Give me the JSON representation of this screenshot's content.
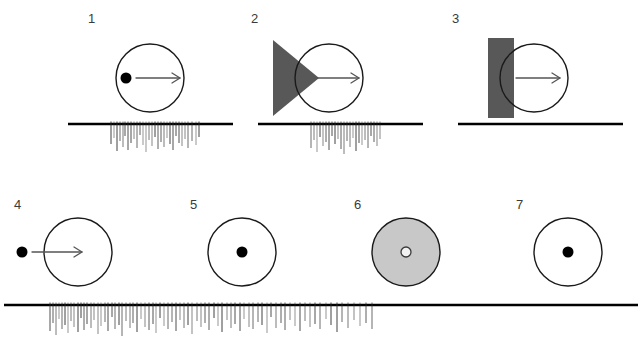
{
  "figure": {
    "kind": "neurophysiology-stimulus-response-figure",
    "background_color": "#ffffff",
    "ink_color": "#000000",
    "label_color": "#3a3a3a",
    "shape_dark_gray": "#585858",
    "shape_light_gray": "#c8c8c8",
    "circle_stroke": "#1a1a1a",
    "arrow_color": "#555555",
    "spike_color": "#2b2b2b",
    "baseline_color": "#000000"
  },
  "panels": [
    {
      "label": "1",
      "label_x": 88,
      "label_y": 12,
      "stimulus": {
        "name": "dot-inside-circle-moving-right",
        "circle": {
          "cx": 72,
          "cy": 58,
          "r": 34,
          "fill": "none"
        },
        "dot": {
          "cx": 48,
          "cy": 58,
          "r": 5.5,
          "style": "filled"
        },
        "arrow": {
          "x1": 58,
          "y1": 58,
          "x2": 102,
          "y2": 58
        },
        "occluder": null
      },
      "trace": {
        "name": "spike-train-1",
        "x": 68,
        "y": 118,
        "width": 165,
        "height": 36,
        "baseline_y": 6,
        "responds": true,
        "spike_start": 42,
        "spike_end": 132,
        "spikes": [
          {
            "x": 43,
            "h": 20
          },
          {
            "x": 46,
            "h": 14
          },
          {
            "x": 49,
            "h": 27
          },
          {
            "x": 52,
            "h": 17
          },
          {
            "x": 55,
            "h": 23
          },
          {
            "x": 57,
            "h": 12
          },
          {
            "x": 60,
            "h": 26
          },
          {
            "x": 63,
            "h": 19
          },
          {
            "x": 66,
            "h": 15
          },
          {
            "x": 69,
            "h": 24
          },
          {
            "x": 72,
            "h": 11
          },
          {
            "x": 75,
            "h": 21
          },
          {
            "x": 78,
            "h": 28
          },
          {
            "x": 81,
            "h": 16
          },
          {
            "x": 84,
            "h": 22
          },
          {
            "x": 87,
            "h": 13
          },
          {
            "x": 90,
            "h": 25
          },
          {
            "x": 93,
            "h": 18
          },
          {
            "x": 96,
            "h": 23
          },
          {
            "x": 99,
            "h": 14
          },
          {
            "x": 102,
            "h": 20
          },
          {
            "x": 105,
            "h": 26
          },
          {
            "x": 108,
            "h": 12
          },
          {
            "x": 111,
            "h": 19
          },
          {
            "x": 114,
            "h": 22
          },
          {
            "x": 117,
            "h": 15
          },
          {
            "x": 120,
            "h": 24
          },
          {
            "x": 124,
            "h": 17
          },
          {
            "x": 128,
            "h": 21
          },
          {
            "x": 131,
            "h": 13
          }
        ]
      }
    },
    {
      "label": "2",
      "label_x": 251,
      "label_y": 12,
      "stimulus": {
        "name": "triangle-occluder-with-circle-moving-right",
        "circle": {
          "cx": 88,
          "cy": 58,
          "r": 34,
          "fill": "none"
        },
        "dot": null,
        "arrow": {
          "x1": 74,
          "y1": 58,
          "x2": 118,
          "y2": 58
        },
        "occluder": {
          "shape": "triangle",
          "points": "32,20 32,96 78,58",
          "fill": "#585858"
        }
      },
      "trace": {
        "name": "spike-train-2",
        "x": 258,
        "y": 118,
        "width": 165,
        "height": 36,
        "baseline_y": 6,
        "responds": true,
        "spike_start": 52,
        "spike_end": 122,
        "spikes": [
          {
            "x": 53,
            "h": 24
          },
          {
            "x": 56,
            "h": 16
          },
          {
            "x": 59,
            "h": 28
          },
          {
            "x": 62,
            "h": 13
          },
          {
            "x": 65,
            "h": 22
          },
          {
            "x": 68,
            "h": 18
          },
          {
            "x": 71,
            "h": 26
          },
          {
            "x": 74,
            "h": 12
          },
          {
            "x": 77,
            "h": 20
          },
          {
            "x": 80,
            "h": 15
          },
          {
            "x": 83,
            "h": 25
          },
          {
            "x": 86,
            "h": 30
          },
          {
            "x": 89,
            "h": 17
          },
          {
            "x": 92,
            "h": 23
          },
          {
            "x": 95,
            "h": 14
          },
          {
            "x": 98,
            "h": 27
          },
          {
            "x": 101,
            "h": 19
          },
          {
            "x": 104,
            "h": 21
          },
          {
            "x": 107,
            "h": 16
          },
          {
            "x": 110,
            "h": 24
          },
          {
            "x": 113,
            "h": 12
          },
          {
            "x": 116,
            "h": 18
          },
          {
            "x": 119,
            "h": 22
          },
          {
            "x": 122,
            "h": 15
          }
        ]
      }
    },
    {
      "label": "3",
      "label_x": 452,
      "label_y": 12,
      "stimulus": {
        "name": "bar-occluder-with-circle-moving-right",
        "circle": {
          "cx": 92,
          "cy": 58,
          "r": 34,
          "fill": "none"
        },
        "dot": null,
        "arrow": {
          "x1": 74,
          "y1": 58,
          "x2": 118,
          "y2": 58
        },
        "occluder": {
          "shape": "rect",
          "x": 46,
          "y": 18,
          "width": 26,
          "height": 80,
          "fill": "#585858"
        }
      },
      "trace": {
        "name": "spike-train-3",
        "x": 458,
        "y": 118,
        "width": 165,
        "height": 36,
        "baseline_y": 6,
        "responds": false,
        "spike_start": 0,
        "spike_end": 0,
        "spikes": []
      }
    },
    {
      "label": "4",
      "label_x": 14,
      "label_y": 198,
      "stimulus": {
        "name": "dot-outside-circle-moving-right",
        "circle": {
          "cx": 74,
          "cy": 46,
          "r": 34,
          "fill": "none"
        },
        "dot": {
          "cx": 18,
          "cy": 46,
          "r": 5.5,
          "style": "filled"
        },
        "arrow": {
          "x1": 28,
          "y1": 46,
          "x2": 78,
          "y2": 46
        },
        "occluder": null
      },
      "trace": null
    },
    {
      "label": "5",
      "label_x": 190,
      "label_y": 198,
      "stimulus": {
        "name": "circle-with-center-dot",
        "circle": {
          "cx": 62,
          "cy": 46,
          "r": 34,
          "fill": "none"
        },
        "dot": {
          "cx": 62,
          "cy": 46,
          "r": 5.5,
          "style": "filled"
        },
        "arrow": null,
        "occluder": null
      },
      "trace": null
    },
    {
      "label": "6",
      "label_x": 354,
      "label_y": 198,
      "stimulus": {
        "name": "gray-filled-circle-with-hollow-center-dot",
        "circle": {
          "cx": 62,
          "cy": 46,
          "r": 34,
          "fill": "#c8c8c8"
        },
        "dot": {
          "cx": 62,
          "cy": 46,
          "r": 5.0,
          "style": "hollow"
        },
        "arrow": null,
        "occluder": null
      },
      "trace": null
    },
    {
      "label": "7",
      "label_x": 516,
      "label_y": 198,
      "stimulus": {
        "name": "circle-with-center-dot",
        "circle": {
          "cx": 62,
          "cy": 46,
          "r": 34,
          "fill": "none"
        },
        "dot": {
          "cx": 62,
          "cy": 46,
          "r": 5.5,
          "style": "filled"
        },
        "arrow": null,
        "occluder": null
      },
      "trace": null
    }
  ],
  "bottom_trace": {
    "name": "spike-train-bottom-row",
    "x": 4,
    "y": 296,
    "width": 634,
    "height": 42,
    "baseline_y": 9,
    "responds": true,
    "spike_start": 45,
    "spike_end": 370,
    "spikes": [
      {
        "x": 46,
        "h": 26
      },
      {
        "x": 49,
        "h": 18
      },
      {
        "x": 52,
        "h": 30
      },
      {
        "x": 55,
        "h": 14
      },
      {
        "x": 58,
        "h": 24
      },
      {
        "x": 61,
        "h": 20
      },
      {
        "x": 64,
        "h": 28
      },
      {
        "x": 67,
        "h": 16
      },
      {
        "x": 70,
        "h": 22
      },
      {
        "x": 74,
        "h": 27
      },
      {
        "x": 77,
        "h": 13
      },
      {
        "x": 80,
        "h": 25
      },
      {
        "x": 83,
        "h": 19
      },
      {
        "x": 87,
        "h": 23
      },
      {
        "x": 90,
        "h": 15
      },
      {
        "x": 94,
        "h": 29
      },
      {
        "x": 97,
        "h": 21
      },
      {
        "x": 101,
        "h": 17
      },
      {
        "x": 104,
        "h": 26
      },
      {
        "x": 108,
        "h": 12
      },
      {
        "x": 111,
        "h": 24
      },
      {
        "x": 115,
        "h": 20
      },
      {
        "x": 118,
        "h": 31
      },
      {
        "x": 122,
        "h": 16
      },
      {
        "x": 126,
        "h": 23
      },
      {
        "x": 129,
        "h": 18
      },
      {
        "x": 133,
        "h": 27
      },
      {
        "x": 137,
        "h": 14
      },
      {
        "x": 141,
        "h": 22
      },
      {
        "x": 145,
        "h": 25
      },
      {
        "x": 149,
        "h": 19
      },
      {
        "x": 152,
        "h": 28
      },
      {
        "x": 156,
        "h": 13
      },
      {
        "x": 160,
        "h": 21
      },
      {
        "x": 164,
        "h": 24
      },
      {
        "x": 168,
        "h": 17
      },
      {
        "x": 172,
        "h": 26
      },
      {
        "x": 176,
        "h": 15
      },
      {
        "x": 180,
        "h": 23
      },
      {
        "x": 184,
        "h": 20
      },
      {
        "x": 188,
        "h": 29
      },
      {
        "x": 193,
        "h": 16
      },
      {
        "x": 197,
        "h": 22
      },
      {
        "x": 201,
        "h": 18
      },
      {
        "x": 205,
        "h": 25
      },
      {
        "x": 210,
        "h": 13
      },
      {
        "x": 214,
        "h": 21
      },
      {
        "x": 218,
        "h": 27
      },
      {
        "x": 223,
        "h": 15
      },
      {
        "x": 227,
        "h": 23
      },
      {
        "x": 231,
        "h": 19
      },
      {
        "x": 236,
        "h": 26
      },
      {
        "x": 240,
        "h": 14
      },
      {
        "x": 245,
        "h": 22
      },
      {
        "x": 249,
        "h": 24
      },
      {
        "x": 254,
        "h": 17
      },
      {
        "x": 258,
        "h": 20
      },
      {
        "x": 263,
        "h": 28
      },
      {
        "x": 267,
        "h": 12
      },
      {
        "x": 272,
        "h": 23
      },
      {
        "x": 277,
        "h": 18
      },
      {
        "x": 281,
        "h": 25
      },
      {
        "x": 286,
        "h": 15
      },
      {
        "x": 291,
        "h": 21
      },
      {
        "x": 296,
        "h": 26
      },
      {
        "x": 301,
        "h": 16
      },
      {
        "x": 306,
        "h": 22
      },
      {
        "x": 311,
        "h": 19
      },
      {
        "x": 316,
        "h": 24
      },
      {
        "x": 322,
        "h": 14
      },
      {
        "x": 327,
        "h": 20
      },
      {
        "x": 333,
        "h": 27
      },
      {
        "x": 338,
        "h": 17
      },
      {
        "x": 344,
        "h": 23
      },
      {
        "x": 350,
        "h": 15
      },
      {
        "x": 356,
        "h": 21
      },
      {
        "x": 362,
        "h": 18
      },
      {
        "x": 368,
        "h": 24
      }
    ]
  }
}
